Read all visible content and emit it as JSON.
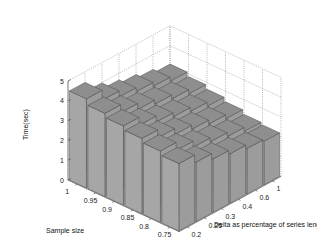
{
  "chart_data": {
    "type": "bar3d",
    "title": "",
    "xlabel": "Sample size",
    "ylabel": "Delta as percentage of series length",
    "zlabel": "Time(sec)",
    "x_ticks": [
      "1",
      "0.95",
      "0.9",
      "0.85",
      "0.8",
      "0.75"
    ],
    "y_ticks": [
      "0.2",
      "0.25",
      "0.3",
      "0.4",
      "0.6",
      "1"
    ],
    "z_ticks": [
      "0",
      "1",
      "2",
      "3",
      "4",
      "5"
    ],
    "zlim": [
      0,
      5
    ],
    "grid": true,
    "values": [
      [
        2.2,
        2.3,
        2.5,
        2.7,
        3.0,
        3.4
      ],
      [
        2.3,
        2.5,
        2.7,
        2.9,
        3.2,
        3.6
      ],
      [
        2.5,
        2.7,
        2.9,
        3.1,
        3.4,
        3.8
      ],
      [
        2.7,
        2.9,
        3.1,
        3.3,
        3.6,
        4.0
      ],
      [
        2.9,
        3.1,
        3.3,
        3.5,
        3.8,
        4.2
      ],
      [
        3.1,
        3.3,
        3.5,
        3.7,
        4.0,
        4.5
      ]
    ],
    "values_note": "rows = Sample size (1 → 0.75), cols = Delta (0.2 → 1); heights estimated from rendering"
  }
}
